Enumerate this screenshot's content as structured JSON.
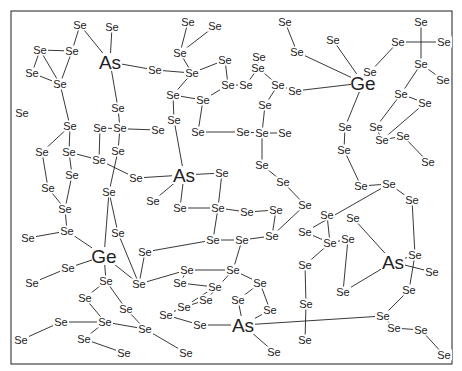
{
  "diagram": {
    "frame": {
      "x": 11,
      "y": 11,
      "w": 441,
      "h": 353
    },
    "atoms": [
      {
        "id": "As1",
        "el": "As",
        "x": 110,
        "y": 62
      },
      {
        "id": "As2",
        "el": "As",
        "x": 184,
        "y": 175
      },
      {
        "id": "Ge1",
        "el": "Ge",
        "x": 363,
        "y": 83
      },
      {
        "id": "Ge2",
        "el": "Ge",
        "x": 104,
        "y": 256
      },
      {
        "id": "As3",
        "el": "As",
        "x": 393,
        "y": 262
      },
      {
        "id": "As4",
        "el": "As",
        "x": 243,
        "y": 325
      },
      {
        "id": "a1",
        "el": "Se",
        "x": 80,
        "y": 25
      },
      {
        "id": "a2",
        "el": "Se",
        "x": 112,
        "y": 27
      },
      {
        "id": "a3",
        "el": "Se",
        "x": 40,
        "y": 50
      },
      {
        "id": "a4",
        "el": "Se",
        "x": 72,
        "y": 51
      },
      {
        "id": "a5",
        "el": "Se",
        "x": 32,
        "y": 73
      },
      {
        "id": "a6",
        "el": "Se",
        "x": 60,
        "y": 84
      },
      {
        "id": "a7",
        "el": "Se",
        "x": 118,
        "y": 108
      },
      {
        "id": "a8",
        "el": "Se",
        "x": 22,
        "y": 113
      },
      {
        "id": "a9",
        "el": "Se",
        "x": 70,
        "y": 126
      },
      {
        "id": "a10",
        "el": "Se",
        "x": 100,
        "y": 128
      },
      {
        "id": "a11",
        "el": "Se",
        "x": 120,
        "y": 128
      },
      {
        "id": "a12",
        "el": "Se",
        "x": 42,
        "y": 152
      },
      {
        "id": "a13",
        "el": "Se",
        "x": 69,
        "y": 152
      },
      {
        "id": "a14",
        "el": "Se",
        "x": 72,
        "y": 175
      },
      {
        "id": "a15",
        "el": "Se",
        "x": 118,
        "y": 151
      },
      {
        "id": "a16",
        "el": "Se",
        "x": 99,
        "y": 160
      },
      {
        "id": "a17",
        "el": "Se",
        "x": 136,
        "y": 178
      },
      {
        "id": "a18",
        "el": "Se",
        "x": 48,
        "y": 188
      },
      {
        "id": "a19",
        "el": "Se",
        "x": 65,
        "y": 209
      },
      {
        "id": "a20",
        "el": "Se",
        "x": 109,
        "y": 192
      },
      {
        "id": "a21",
        "el": "Se",
        "x": 28,
        "y": 238
      },
      {
        "id": "a22",
        "el": "Se",
        "x": 67,
        "y": 231
      },
      {
        "id": "b1",
        "el": "Se",
        "x": 188,
        "y": 22
      },
      {
        "id": "b2",
        "el": "Se",
        "x": 215,
        "y": 26
      },
      {
        "id": "b3",
        "el": "Se",
        "x": 180,
        "y": 53
      },
      {
        "id": "b4",
        "el": "Se",
        "x": 155,
        "y": 70
      },
      {
        "id": "b5",
        "el": "Se",
        "x": 192,
        "y": 73
      },
      {
        "id": "b6",
        "el": "Se",
        "x": 225,
        "y": 60
      },
      {
        "id": "b7",
        "el": "Se",
        "x": 228,
        "y": 85
      },
      {
        "id": "b8",
        "el": "Se",
        "x": 246,
        "y": 85
      },
      {
        "id": "b9",
        "el": "Se",
        "x": 173,
        "y": 95
      },
      {
        "id": "b10",
        "el": "Se",
        "x": 203,
        "y": 100
      },
      {
        "id": "b11",
        "el": "Se",
        "x": 174,
        "y": 120
      },
      {
        "id": "b12",
        "el": "Se",
        "x": 198,
        "y": 132
      },
      {
        "id": "b13",
        "el": "Se",
        "x": 158,
        "y": 130
      },
      {
        "id": "b14",
        "el": "Se",
        "x": 258,
        "y": 68
      },
      {
        "id": "b15",
        "el": "Se",
        "x": 278,
        "y": 85
      },
      {
        "id": "b16",
        "el": "Se",
        "x": 295,
        "y": 91
      },
      {
        "id": "b17",
        "el": "Se",
        "x": 265,
        "y": 105
      },
      {
        "id": "b18",
        "el": "Se",
        "x": 243,
        "y": 132
      },
      {
        "id": "b19",
        "el": "Se",
        "x": 262,
        "y": 133
      },
      {
        "id": "b20",
        "el": "Se",
        "x": 285,
        "y": 133
      },
      {
        "id": "b21",
        "el": "Se",
        "x": 222,
        "y": 173
      },
      {
        "id": "b22",
        "el": "Se",
        "x": 262,
        "y": 165
      },
      {
        "id": "b23",
        "el": "Se",
        "x": 283,
        "y": 182
      },
      {
        "id": "b24",
        "el": "Se",
        "x": 305,
        "y": 205
      },
      {
        "id": "b25",
        "el": "Se",
        "x": 180,
        "y": 208
      },
      {
        "id": "b26",
        "el": "Se",
        "x": 218,
        "y": 208
      },
      {
        "id": "b27",
        "el": "Se",
        "x": 247,
        "y": 212
      },
      {
        "id": "b28",
        "el": "Se",
        "x": 213,
        "y": 240
      },
      {
        "id": "b29",
        "el": "Se",
        "x": 242,
        "y": 240
      },
      {
        "id": "b30",
        "el": "Se",
        "x": 276,
        "y": 210
      },
      {
        "id": "b31",
        "el": "Se",
        "x": 272,
        "y": 236
      },
      {
        "id": "c1",
        "el": "Se",
        "x": 285,
        "y": 22
      },
      {
        "id": "c2",
        "el": "Se",
        "x": 297,
        "y": 52
      },
      {
        "id": "c3",
        "el": "Se",
        "x": 259,
        "y": 57
      },
      {
        "id": "c4",
        "el": "Se",
        "x": 333,
        "y": 40
      },
      {
        "id": "c5",
        "el": "Se",
        "x": 370,
        "y": 72
      },
      {
        "id": "c6",
        "el": "Se",
        "x": 398,
        "y": 42
      },
      {
        "id": "c7",
        "el": "Se",
        "x": 421,
        "y": 22
      },
      {
        "id": "c8",
        "el": "Se",
        "x": 444,
        "y": 42
      },
      {
        "id": "c9",
        "el": "Se",
        "x": 421,
        "y": 64
      },
      {
        "id": "c10",
        "el": "Se",
        "x": 443,
        "y": 80
      },
      {
        "id": "c11",
        "el": "Se",
        "x": 401,
        "y": 94
      },
      {
        "id": "c12",
        "el": "Se",
        "x": 425,
        "y": 103
      },
      {
        "id": "c13",
        "el": "Se",
        "x": 345,
        "y": 127
      },
      {
        "id": "c14",
        "el": "Se",
        "x": 376,
        "y": 127
      },
      {
        "id": "c15",
        "el": "Se",
        "x": 382,
        "y": 140
      },
      {
        "id": "c16",
        "el": "Se",
        "x": 344,
        "y": 150
      },
      {
        "id": "c17",
        "el": "Se",
        "x": 403,
        "y": 136
      },
      {
        "id": "c18",
        "el": "Se",
        "x": 428,
        "y": 162
      },
      {
        "id": "c19",
        "el": "Se",
        "x": 361,
        "y": 186
      },
      {
        "id": "c20",
        "el": "Se",
        "x": 389,
        "y": 184
      },
      {
        "id": "c21",
        "el": "Se",
        "x": 412,
        "y": 200
      },
      {
        "id": "c22",
        "el": "Se",
        "x": 327,
        "y": 215
      },
      {
        "id": "c23",
        "el": "Se",
        "x": 353,
        "y": 218
      },
      {
        "id": "c24",
        "el": "Se",
        "x": 305,
        "y": 232
      },
      {
        "id": "c25",
        "el": "Se",
        "x": 330,
        "y": 243
      },
      {
        "id": "c26",
        "el": "Se",
        "x": 348,
        "y": 239
      },
      {
        "id": "c27",
        "el": "Se",
        "x": 415,
        "y": 255
      },
      {
        "id": "c28",
        "el": "Se",
        "x": 432,
        "y": 272
      },
      {
        "id": "c29",
        "el": "Se",
        "x": 409,
        "y": 290
      },
      {
        "id": "c30",
        "el": "Se",
        "x": 343,
        "y": 292
      },
      {
        "id": "c31",
        "el": "Se",
        "x": 305,
        "y": 265
      },
      {
        "id": "c32",
        "el": "Se",
        "x": 306,
        "y": 304
      },
      {
        "id": "c33",
        "el": "Se",
        "x": 383,
        "y": 316
      },
      {
        "id": "c34",
        "el": "Se",
        "x": 394,
        "y": 328
      },
      {
        "id": "c35",
        "el": "Se",
        "x": 421,
        "y": 330
      },
      {
        "id": "c36",
        "el": "Se",
        "x": 444,
        "y": 355
      },
      {
        "id": "c37",
        "el": "Se",
        "x": 305,
        "y": 340
      },
      {
        "id": "d1",
        "el": "Se",
        "x": 68,
        "y": 268
      },
      {
        "id": "d2",
        "el": "Se",
        "x": 32,
        "y": 283
      },
      {
        "id": "d3",
        "el": "Se",
        "x": 106,
        "y": 281
      },
      {
        "id": "d4",
        "el": "Se",
        "x": 85,
        "y": 298
      },
      {
        "id": "d5",
        "el": "Se",
        "x": 139,
        "y": 284
      },
      {
        "id": "d6",
        "el": "Se",
        "x": 126,
        "y": 309
      },
      {
        "id": "d7",
        "el": "Se",
        "x": 61,
        "y": 322
      },
      {
        "id": "d8",
        "el": "Se",
        "x": 105,
        "y": 322
      },
      {
        "id": "d9",
        "el": "Se",
        "x": 145,
        "y": 329
      },
      {
        "id": "d10",
        "el": "Se",
        "x": 21,
        "y": 340
      },
      {
        "id": "d11",
        "el": "Se",
        "x": 84,
        "y": 339
      },
      {
        "id": "d12",
        "el": "Se",
        "x": 124,
        "y": 353
      },
      {
        "id": "d13",
        "el": "Se",
        "x": 145,
        "y": 252
      },
      {
        "id": "d14",
        "el": "Se",
        "x": 187,
        "y": 270
      },
      {
        "id": "d15",
        "el": "Se",
        "x": 180,
        "y": 283
      },
      {
        "id": "d16",
        "el": "Se",
        "x": 215,
        "y": 287
      },
      {
        "id": "d17",
        "el": "Se",
        "x": 233,
        "y": 270
      },
      {
        "id": "d18",
        "el": "Se",
        "x": 260,
        "y": 283
      },
      {
        "id": "d19",
        "el": "Se",
        "x": 184,
        "y": 307
      },
      {
        "id": "d20",
        "el": "Se",
        "x": 206,
        "y": 300
      },
      {
        "id": "d21",
        "el": "Se",
        "x": 238,
        "y": 300
      },
      {
        "id": "d22",
        "el": "Se",
        "x": 166,
        "y": 315
      },
      {
        "id": "d23",
        "el": "Se",
        "x": 200,
        "y": 325
      },
      {
        "id": "d24",
        "el": "Se",
        "x": 186,
        "y": 353
      },
      {
        "id": "d25",
        "el": "Se",
        "x": 274,
        "y": 352
      },
      {
        "id": "d26",
        "el": "Se",
        "x": 270,
        "y": 310
      },
      {
        "id": "d27",
        "el": "Se",
        "x": 153,
        "y": 201
      },
      {
        "id": "d28",
        "el": "Se",
        "x": 118,
        "y": 233
      }
    ],
    "bonds": [
      [
        "a1",
        "As1"
      ],
      [
        "a2",
        "As1"
      ],
      [
        "As1",
        "b4"
      ],
      [
        "As1",
        "a7"
      ],
      [
        "a1",
        "a4"
      ],
      [
        "a4",
        "a6"
      ],
      [
        "a3",
        "a6"
      ],
      [
        "a6",
        "a5"
      ],
      [
        "a4",
        "a3"
      ],
      [
        "a6",
        "a9"
      ],
      [
        "a5",
        "a3"
      ],
      [
        "a9",
        "a13"
      ],
      [
        "a7",
        "a11"
      ],
      [
        "a11",
        "a15"
      ],
      [
        "a10",
        "a16"
      ],
      [
        "a13",
        "a16"
      ],
      [
        "a9",
        "a12"
      ],
      [
        "a12",
        "a18"
      ],
      [
        "a13",
        "a14"
      ],
      [
        "a14",
        "a19"
      ],
      [
        "a18",
        "a19"
      ],
      [
        "a19",
        "a22"
      ],
      [
        "a22",
        "a21"
      ],
      [
        "a16",
        "a17"
      ],
      [
        "a15",
        "a20"
      ],
      [
        "a20",
        "d28"
      ],
      [
        "a10",
        "b13"
      ],
      [
        "a17",
        "As2"
      ],
      [
        "b1",
        "b3"
      ],
      [
        "b2",
        "b3"
      ],
      [
        "b3",
        "b5"
      ],
      [
        "b4",
        "b5"
      ],
      [
        "b5",
        "b6"
      ],
      [
        "b5",
        "b9"
      ],
      [
        "b6",
        "b7"
      ],
      [
        "b7",
        "b10"
      ],
      [
        "b9",
        "b10"
      ],
      [
        "b10",
        "b12"
      ],
      [
        "b9",
        "b11"
      ],
      [
        "b11",
        "As2"
      ],
      [
        "b13",
        "b11"
      ],
      [
        "b7",
        "b8"
      ],
      [
        "b8",
        "b14"
      ],
      [
        "b14",
        "b15"
      ],
      [
        "b15",
        "b16"
      ],
      [
        "b15",
        "b17"
      ],
      [
        "b17",
        "b19"
      ],
      [
        "b18",
        "b19"
      ],
      [
        "b19",
        "b20"
      ],
      [
        "b19",
        "b22"
      ],
      [
        "b22",
        "b23"
      ],
      [
        "b23",
        "b24"
      ],
      [
        "b12",
        "b18"
      ],
      [
        "As2",
        "b21"
      ],
      [
        "As2",
        "d27"
      ],
      [
        "As2",
        "b25"
      ],
      [
        "b25",
        "b26"
      ],
      [
        "b21",
        "b26"
      ],
      [
        "b26",
        "b28"
      ],
      [
        "b28",
        "b29"
      ],
      [
        "b26",
        "b27"
      ],
      [
        "b27",
        "b30"
      ],
      [
        "b30",
        "b31"
      ],
      [
        "b24",
        "b31"
      ],
      [
        "b29",
        "b31"
      ],
      [
        "b28",
        "d13"
      ],
      [
        "c1",
        "c2"
      ],
      [
        "c2",
        "Ge1"
      ],
      [
        "c3",
        "b14"
      ],
      [
        "c4",
        "Ge1"
      ],
      [
        "Ge1",
        "c5"
      ],
      [
        "Ge1",
        "b16"
      ],
      [
        "Ge1",
        "c13"
      ],
      [
        "c5",
        "c6"
      ],
      [
        "c6",
        "c8"
      ],
      [
        "c7",
        "c9"
      ],
      [
        "c9",
        "c11"
      ],
      [
        "c11",
        "c12"
      ],
      [
        "c9",
        "c10"
      ],
      [
        "c12",
        "c15"
      ],
      [
        "c11",
        "c14"
      ],
      [
        "c14",
        "c15"
      ],
      [
        "c13",
        "c16"
      ],
      [
        "c16",
        "c19"
      ],
      [
        "c15",
        "c17"
      ],
      [
        "c17",
        "c18"
      ],
      [
        "c19",
        "c20"
      ],
      [
        "c20",
        "c21"
      ],
      [
        "c20",
        "c24"
      ],
      [
        "c21",
        "c27"
      ],
      [
        "c22",
        "c25"
      ],
      [
        "c23",
        "As3"
      ],
      [
        "c24",
        "c25"
      ],
      [
        "c25",
        "c26"
      ],
      [
        "c26",
        "c30"
      ],
      [
        "As3",
        "c30"
      ],
      [
        "As3",
        "c27"
      ],
      [
        "As3",
        "c28"
      ],
      [
        "c27",
        "c29"
      ],
      [
        "c29",
        "c33"
      ],
      [
        "c31",
        "c32"
      ],
      [
        "c32",
        "c37"
      ],
      [
        "c33",
        "c34"
      ],
      [
        "c34",
        "c35"
      ],
      [
        "c35",
        "c36"
      ],
      [
        "c25",
        "c31"
      ],
      [
        "c33",
        "As4"
      ],
      [
        "Ge2",
        "a22"
      ],
      [
        "Ge2",
        "d3"
      ],
      [
        "Ge2",
        "d5"
      ],
      [
        "Ge2",
        "d1"
      ],
      [
        "Ge2",
        "a20"
      ],
      [
        "d1",
        "d2"
      ],
      [
        "d3",
        "d4"
      ],
      [
        "d3",
        "d6"
      ],
      [
        "d4",
        "d8"
      ],
      [
        "d7",
        "d8"
      ],
      [
        "d8",
        "d9"
      ],
      [
        "d6",
        "d9"
      ],
      [
        "d8",
        "d11"
      ],
      [
        "d7",
        "d10"
      ],
      [
        "d11",
        "d12"
      ],
      [
        "d5",
        "d14"
      ],
      [
        "d13",
        "d5"
      ],
      [
        "d14",
        "d15"
      ],
      [
        "d15",
        "d16"
      ],
      [
        "d16",
        "d19"
      ],
      [
        "d14",
        "d17"
      ],
      [
        "d17",
        "d18"
      ],
      [
        "d17",
        "d20"
      ],
      [
        "d20",
        "d19"
      ],
      [
        "d19",
        "d22"
      ],
      [
        "d22",
        "d23"
      ],
      [
        "d23",
        "As4"
      ],
      [
        "As4",
        "d21"
      ],
      [
        "d21",
        "d18"
      ],
      [
        "As4",
        "d25"
      ],
      [
        "d9",
        "d24"
      ],
      [
        "d18",
        "d26"
      ],
      [
        "d26",
        "As4"
      ],
      [
        "b29",
        "d17"
      ],
      [
        "d28",
        "d5"
      ]
    ]
  }
}
